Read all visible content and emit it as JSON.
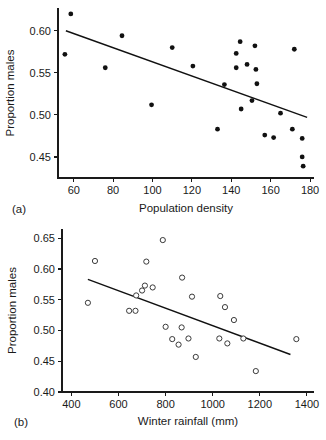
{
  "figure": {
    "panel_a_label": "(a)",
    "panel_b_label": "(b)",
    "caption_partial": ""
  },
  "chart_data": [
    {
      "id": "panel-a",
      "type": "scatter",
      "title": "",
      "panel_label": "(a)",
      "xlabel": "Population density",
      "ylabel": "Proportion males",
      "xlim": [
        52,
        182
      ],
      "ylim": [
        0.425,
        0.627
      ],
      "xticks": [
        60,
        80,
        100,
        120,
        140,
        160,
        180
      ],
      "xtick_labels": [
        "60",
        "80",
        "100",
        "120",
        "140",
        "160",
        "180"
      ],
      "yticks": [
        0.45,
        0.5,
        0.55,
        0.6
      ],
      "ytick_labels": [
        "0.45",
        "0.50",
        "0.55",
        "0.60"
      ],
      "grid": false,
      "legend": "none",
      "marker": "filled-circle",
      "points": [
        {
          "x": 58.5,
          "y": 0.62
        },
        {
          "x": 55.5,
          "y": 0.572
        },
        {
          "x": 76.0,
          "y": 0.556
        },
        {
          "x": 84.5,
          "y": 0.594
        },
        {
          "x": 99.5,
          "y": 0.512
        },
        {
          "x": 110.0,
          "y": 0.58
        },
        {
          "x": 120.5,
          "y": 0.558
        },
        {
          "x": 133.0,
          "y": 0.483
        },
        {
          "x": 136.5,
          "y": 0.536
        },
        {
          "x": 142.5,
          "y": 0.573
        },
        {
          "x": 142.5,
          "y": 0.556
        },
        {
          "x": 144.5,
          "y": 0.587
        },
        {
          "x": 145.0,
          "y": 0.507
        },
        {
          "x": 148.0,
          "y": 0.56
        },
        {
          "x": 150.5,
          "y": 0.517
        },
        {
          "x": 152.0,
          "y": 0.582
        },
        {
          "x": 152.5,
          "y": 0.554
        },
        {
          "x": 153.0,
          "y": 0.537
        },
        {
          "x": 157.0,
          "y": 0.476
        },
        {
          "x": 161.5,
          "y": 0.473
        },
        {
          "x": 165.0,
          "y": 0.502
        },
        {
          "x": 171.0,
          "y": 0.483
        },
        {
          "x": 172.0,
          "y": 0.578
        },
        {
          "x": 176.0,
          "y": 0.472
        },
        {
          "x": 176.0,
          "y": 0.45
        },
        {
          "x": 176.5,
          "y": 0.439
        }
      ],
      "trend_line": {
        "x1": 56.0,
        "y1": 0.6,
        "x2": 178.5,
        "y2": 0.497
      }
    },
    {
      "id": "panel-b",
      "type": "scatter",
      "title": "",
      "panel_label": "(b)",
      "xlabel": "Winter rainfall (mm)",
      "ylabel": "Proportion males",
      "xlim": [
        360,
        1430
      ],
      "ylim": [
        0.4,
        0.665
      ],
      "xticks": [
        400,
        600,
        800,
        1000,
        1200,
        1400
      ],
      "xtick_labels": [
        "400",
        "600",
        "800",
        "1000",
        "1200",
        "1400"
      ],
      "yticks": [
        0.4,
        0.45,
        0.5,
        0.55,
        0.6,
        0.65
      ],
      "ytick_labels": [
        "0.40",
        "0.45",
        "0.50",
        "0.55",
        "0.60",
        "0.65"
      ],
      "grid": false,
      "legend": "none",
      "marker": "open-circle",
      "points": [
        {
          "x": 470,
          "y": 0.545
        },
        {
          "x": 500,
          "y": 0.613
        },
        {
          "x": 645,
          "y": 0.532
        },
        {
          "x": 672,
          "y": 0.532
        },
        {
          "x": 675,
          "y": 0.557
        },
        {
          "x": 700,
          "y": 0.565
        },
        {
          "x": 712,
          "y": 0.573
        },
        {
          "x": 718,
          "y": 0.612
        },
        {
          "x": 745,
          "y": 0.57
        },
        {
          "x": 788,
          "y": 0.647
        },
        {
          "x": 800,
          "y": 0.506
        },
        {
          "x": 828,
          "y": 0.486
        },
        {
          "x": 855,
          "y": 0.477
        },
        {
          "x": 868,
          "y": 0.505
        },
        {
          "x": 870,
          "y": 0.586
        },
        {
          "x": 897,
          "y": 0.487
        },
        {
          "x": 912,
          "y": 0.555
        },
        {
          "x": 928,
          "y": 0.457
        },
        {
          "x": 1028,
          "y": 0.487
        },
        {
          "x": 1032,
          "y": 0.556
        },
        {
          "x": 1052,
          "y": 0.538
        },
        {
          "x": 1062,
          "y": 0.479
        },
        {
          "x": 1090,
          "y": 0.517
        },
        {
          "x": 1130,
          "y": 0.487
        },
        {
          "x": 1183,
          "y": 0.434
        },
        {
          "x": 1355,
          "y": 0.486
        }
      ],
      "trend_line": {
        "x1": 470,
        "y1": 0.583,
        "x2": 1330,
        "y2": 0.461
      }
    }
  ]
}
